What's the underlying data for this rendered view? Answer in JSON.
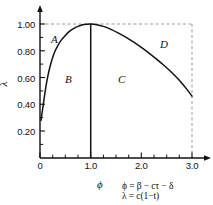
{
  "figure": {
    "background_color": "#ffffff",
    "line_color": "#111111",
    "dashed_color": "#999999"
  },
  "axes": {
    "x_title": "ϕ",
    "y_title": "λ",
    "x_ticks": [
      "0",
      "1.0",
      "2.0",
      "3.0"
    ],
    "y_ticks": [
      "1.00",
      "0.80",
      "0.60",
      "0.40",
      "0.20"
    ]
  },
  "regions": {
    "a": "A",
    "b": "B",
    "c": "C",
    "d": "D"
  },
  "equations": {
    "line1": "ϕ = β − cτ − δ",
    "line2": "λ = c(1−t)"
  },
  "chart_data": {
    "type": "line",
    "title": "",
    "xlabel": "ϕ",
    "ylabel": "λ",
    "xlim": [
      0,
      3.2
    ],
    "ylim": [
      0,
      1.08
    ],
    "xticks": [
      0,
      1.0,
      2.0,
      3.0
    ],
    "xticklabels": [
      "0",
      "1.0",
      "2.0",
      "3.0"
    ],
    "yticks": [
      0.2,
      0.4,
      0.6,
      0.8,
      1.0
    ],
    "yticklabels": [
      "0.20",
      "0.40",
      "0.60",
      "0.80",
      "1.00"
    ],
    "minor_xticks": [
      0.25,
      0.5,
      0.75,
      1.25,
      1.5,
      1.75,
      2.25,
      2.5,
      2.75
    ],
    "minor_yticks": [
      0.1,
      0.3,
      0.5,
      0.7,
      0.9
    ],
    "grid": false,
    "legend": null,
    "series": [
      {
        "name": "boundary-curve",
        "style": "solid",
        "x": [
          0.02,
          0.05,
          0.08,
          0.12,
          0.16,
          0.2,
          0.25,
          0.3,
          0.36,
          0.42,
          0.5,
          0.58,
          0.66,
          0.75,
          0.84,
          0.92,
          1.0,
          1.12,
          1.25,
          1.4,
          1.55,
          1.7,
          1.85,
          2.0,
          2.15,
          2.3,
          2.45,
          2.6,
          2.75,
          2.9,
          3.0
        ],
        "y": [
          0.28,
          0.36,
          0.44,
          0.54,
          0.62,
          0.685,
          0.75,
          0.8,
          0.845,
          0.88,
          0.915,
          0.945,
          0.965,
          0.982,
          0.994,
          0.999,
          1.0,
          0.995,
          0.982,
          0.96,
          0.932,
          0.9,
          0.864,
          0.825,
          0.783,
          0.738,
          0.69,
          0.638,
          0.58,
          0.512,
          0.462
        ]
      },
      {
        "name": "vertical-divider",
        "style": "solid",
        "x": [
          1.0,
          1.0
        ],
        "y": [
          0.0,
          1.0
        ]
      },
      {
        "name": "top-dashed",
        "style": "dashed",
        "x": [
          0.0,
          3.0
        ],
        "y": [
          1.0,
          1.0
        ]
      },
      {
        "name": "right-dashed",
        "style": "dashed",
        "x": [
          3.0,
          3.0
        ],
        "y": [
          1.0,
          0.0
        ]
      }
    ],
    "annotations": [
      {
        "text": "A",
        "x": 0.32,
        "y": 0.915
      },
      {
        "text": "B",
        "x": 0.6,
        "y": 0.6
      },
      {
        "text": "C",
        "x": 1.63,
        "y": 0.6
      },
      {
        "text": "D",
        "x": 2.45,
        "y": 0.875
      },
      {
        "text": "ϕ = β − cτ − δ",
        "x": 1.7,
        "y": -0.18
      },
      {
        "text": "λ = c(1−t)",
        "x": 1.7,
        "y": -0.28
      }
    ]
  }
}
